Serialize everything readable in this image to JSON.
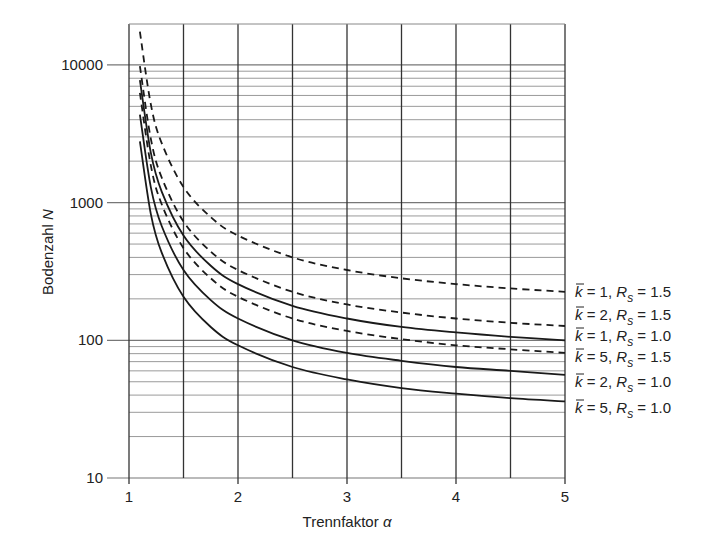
{
  "chart_data": {
    "type": "line",
    "title": "",
    "xlabel": "Trennfaktor",
    "xlabel_symbol": "α",
    "ylabel": "Bodenzahl",
    "ylabel_symbol": "N",
    "xscale": "linear",
    "yscale": "log",
    "xlim": [
      1,
      5
    ],
    "ylim": [
      10,
      25000
    ],
    "x_ticks": [
      "1",
      "2",
      "3",
      "4",
      "5"
    ],
    "y_ticks": [
      "10",
      "100",
      "1000",
      "10000"
    ],
    "grid": true,
    "legend_position": "right, inline labels at curve ends",
    "x": [
      1.1,
      1.2,
      1.3,
      1.5,
      1.75,
      2.0,
      2.5,
      3.0,
      3.5,
      4.0,
      4.5,
      5.0
    ],
    "series": [
      {
        "name": "k̄ = 1, Rs = 1.5",
        "k": "1",
        "rs": "1.5",
        "style": "dashed",
        "values": [
          17424,
          5184,
          2704,
          1296,
          784,
          576,
          400,
          324,
          282,
          256,
          238,
          225
        ]
      },
      {
        "name": "k̄ = 2, Rs = 1.5",
        "k": "2",
        "rs": "1.5",
        "style": "dashed",
        "values": [
          9801,
          2916,
          1521,
          729,
          441,
          324,
          225,
          182,
          159,
          144,
          134,
          127
        ]
      },
      {
        "name": "k̄ = 1, Rs = 1.0",
        "k": "1",
        "rs": "1.0",
        "style": "solid",
        "values": [
          7744,
          2304,
          1202,
          576,
          348,
          256,
          178,
          144,
          125,
          114,
          106,
          100
        ]
      },
      {
        "name": "k̄ = 5, Rs = 1.5",
        "k": "5",
        "rs": "1.5",
        "style": "dashed",
        "values": [
          6273,
          1866,
          973,
          467,
          282,
          207,
          144,
          117,
          102,
          92,
          86,
          81
        ]
      },
      {
        "name": "k̄ = 2, Rs = 1.0",
        "k": "2",
        "rs": "1.0",
        "style": "solid",
        "values": [
          4356,
          1296,
          676,
          324,
          196,
          144,
          100,
          81,
          71,
          64,
          60,
          56
        ]
      },
      {
        "name": "k̄ = 5, Rs = 1.0",
        "k": "5",
        "rs": "1.0",
        "style": "solid",
        "values": [
          2788,
          829,
          433,
          207,
          125,
          92,
          64,
          52,
          45,
          41,
          38,
          36
        ]
      }
    ]
  },
  "labels": {
    "x_axis": "Trennfaktor ",
    "x_symbol": "α",
    "y_axis": "Bodenzahl ",
    "y_symbol": "N"
  }
}
